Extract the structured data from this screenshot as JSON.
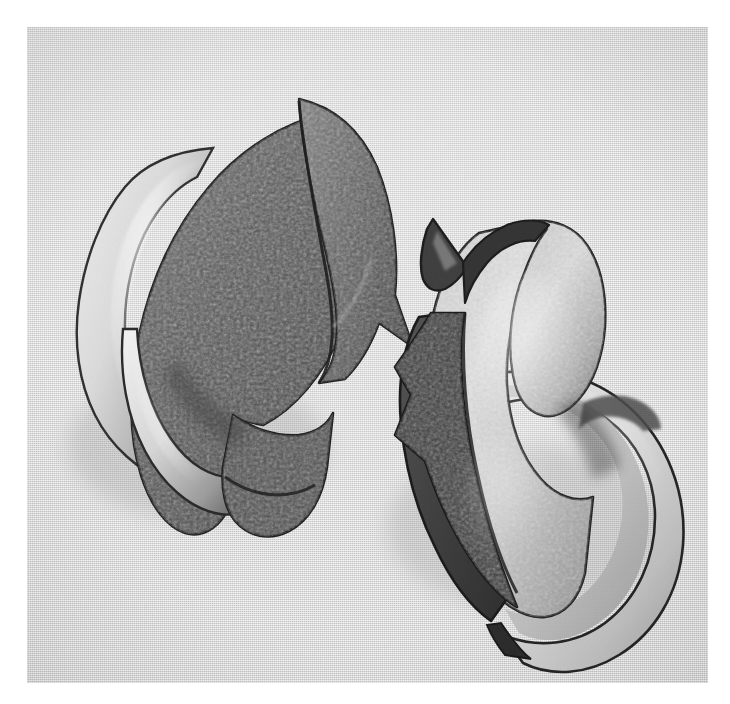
{
  "image": {
    "kind": "black-and-white photograph",
    "subject": "two abstract curved sculptural forms",
    "orientation": "landscape",
    "border_color": "#ffffff",
    "background_color": "#dcdcdc",
    "width": 730,
    "height": 704,
    "plate": {
      "left": 27,
      "top": 27,
      "width": 681,
      "height": 656
    }
  },
  "palette": {
    "paper_white": "#ffffff",
    "background_gray": "#dcdcdc",
    "background_gray_light": "#e6e6e6",
    "background_gray_dark": "#cfcfcf",
    "outline_black": "#1e1e1e",
    "shadow_dark": "#3a3a3a",
    "mid_gray": "#6e6e6e",
    "highlight_gray": "#bdbdbd",
    "specular_white": "#f2f2f2"
  },
  "objects": [
    {
      "id": "sculpture-left",
      "label": "Left sculpture",
      "description": "Upper-left abstract shell form: a dark textured curved blade with a concave notch on the right, a smooth pale inner lip on the left, and a tapering tail at the lower right.",
      "tone": "dark",
      "bounds": {
        "x": 60,
        "y": 80,
        "width": 300,
        "height": 430
      },
      "texture": "crinkled stippled surface",
      "parts": [
        {
          "name": "outer-blade",
          "tone": "dark-textured"
        },
        {
          "name": "inner-lip",
          "tone": "pale-smooth"
        },
        {
          "name": "concave-notch",
          "tone": "mid-gray"
        },
        {
          "name": "tail-tip",
          "tone": "dark"
        }
      ]
    },
    {
      "id": "sculpture-right",
      "label": "Right sculpture",
      "description": "Lower-right abstract shell form: a pale textured curved body with a pointed horn at the top, a dark textured wing on the left, and a broad smooth crescent sweeping to the lower right.",
      "tone": "light",
      "bounds": {
        "x": 370,
        "y": 195,
        "width": 300,
        "height": 440
      },
      "texture": "crinkled stippled surface",
      "parts": [
        {
          "name": "horn-spike",
          "tone": "dark"
        },
        {
          "name": "pale-body",
          "tone": "light-textured"
        },
        {
          "name": "dark-wing",
          "tone": "dark-textured"
        },
        {
          "name": "outer-crescent",
          "tone": "pale-smooth"
        }
      ]
    }
  ]
}
